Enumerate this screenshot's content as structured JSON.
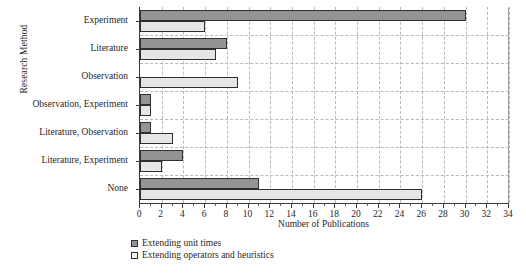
{
  "chart_data": {
    "type": "bar",
    "orientation": "horizontal",
    "title": "",
    "xlabel": "Number of Publications",
    "ylabel": "Research Method",
    "categories": [
      "Experiment",
      "Literature",
      "Observation",
      "Observation, Experiment",
      "Literature, Observation",
      "Literature, Experiment",
      "None"
    ],
    "series": [
      {
        "name": "Extending unit times",
        "color": "#949494",
        "values": [
          30,
          8,
          0,
          1,
          1,
          4,
          11
        ]
      },
      {
        "name": "Extending operators and heuristics",
        "color": "#e6e6e4",
        "values": [
          6,
          7,
          9,
          1,
          3,
          2,
          26
        ]
      }
    ],
    "xlim": [
      0,
      34
    ],
    "xticks": [
      0,
      2,
      4,
      6,
      8,
      10,
      12,
      14,
      16,
      18,
      20,
      22,
      24,
      26,
      28,
      30,
      32,
      34
    ],
    "xtick_labels": [
      "0",
      "2",
      "4",
      "6",
      "8",
      "10",
      "12",
      "14",
      "16",
      "18",
      "20",
      "22",
      "24",
      "26",
      "28",
      "30",
      "32",
      "34"
    ],
    "grid": true,
    "grid_style": "dashed",
    "legend_position": "bottom-left"
  },
  "legend": {
    "items": [
      {
        "label": "Extending unit times",
        "swatch": "dark"
      },
      {
        "label": "Extending operators and heuristics",
        "swatch": "light"
      }
    ]
  }
}
